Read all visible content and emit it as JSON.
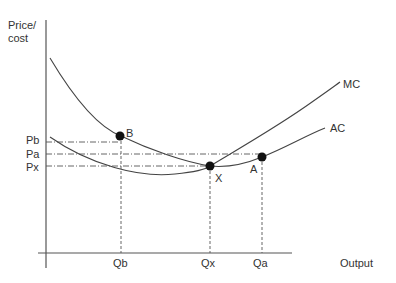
{
  "diagram": {
    "y_axis_label_line1": "Price/",
    "y_axis_label_line2": "cost",
    "x_axis_label": "Output",
    "curves": [
      {
        "name": "MC",
        "label": "MC"
      },
      {
        "name": "AC",
        "label": "AC"
      }
    ],
    "points": [
      {
        "name": "B",
        "label": "B",
        "price": "Pb",
        "quantity": "Qb"
      },
      {
        "name": "X",
        "label": "X",
        "price": "Px",
        "quantity": "Qx"
      },
      {
        "name": "A",
        "label": "A",
        "price": "Pa",
        "quantity": "Qa"
      }
    ],
    "price_labels": {
      "pb": "Pb",
      "pa": "Pa",
      "px": "Px"
    },
    "quantity_labels": {
      "qb": "Qb",
      "qx": "Qx",
      "qa": "Qa"
    },
    "colors": {
      "line": "#444444",
      "point": "#111111",
      "text": "#333333"
    }
  }
}
